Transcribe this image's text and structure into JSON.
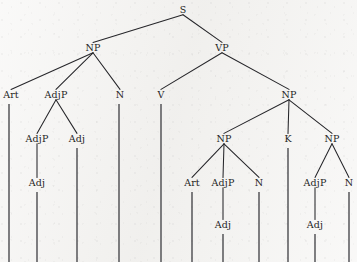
{
  "figure": {
    "kind": "constituency-syntax-tree",
    "width": 357,
    "height": 262,
    "background_color": "#f3f2f0",
    "ink_color": "#26262a",
    "text_color": "#1d1d1d"
  },
  "chart_data": {
    "type": "diagram",
    "title": "",
    "nodes": [
      {
        "id": "S",
        "label": "S",
        "x": 183,
        "y": 13,
        "parent": null
      },
      {
        "id": "NP1",
        "label": "NP",
        "x": 93,
        "y": 51,
        "parent": "S"
      },
      {
        "id": "VP",
        "label": "VP",
        "x": 222,
        "y": 51,
        "parent": "S"
      },
      {
        "id": "Art1",
        "label": "Art",
        "x": 11,
        "y": 98,
        "parent": "NP1"
      },
      {
        "id": "AdjP1",
        "label": "AdjP",
        "x": 56,
        "y": 98,
        "parent": "NP1"
      },
      {
        "id": "N1",
        "label": "N",
        "x": 120,
        "y": 98,
        "parent": "NP1"
      },
      {
        "id": "V",
        "label": "V",
        "x": 161,
        "y": 98,
        "parent": "VP"
      },
      {
        "id": "NP2",
        "label": "NP",
        "x": 289,
        "y": 98,
        "parent": "VP"
      },
      {
        "id": "AdjP2",
        "label": "AdjP",
        "x": 37,
        "y": 142,
        "parent": "AdjP1"
      },
      {
        "id": "Adj1",
        "label": "Adj",
        "x": 77,
        "y": 142,
        "parent": "AdjP1"
      },
      {
        "id": "NP3",
        "label": "NP",
        "x": 224,
        "y": 142,
        "parent": "NP2"
      },
      {
        "id": "K",
        "label": "K",
        "x": 288,
        "y": 142,
        "parent": "NP2"
      },
      {
        "id": "NP4",
        "label": "NP",
        "x": 332,
        "y": 142,
        "parent": "NP2"
      },
      {
        "id": "Adj2",
        "label": "Adj",
        "x": 37,
        "y": 186,
        "parent": "AdjP2"
      },
      {
        "id": "Art2",
        "label": "Art",
        "x": 192,
        "y": 186,
        "parent": "NP3"
      },
      {
        "id": "AdjP3",
        "label": "AdjP",
        "x": 223,
        "y": 186,
        "parent": "NP3"
      },
      {
        "id": "N2",
        "label": "N",
        "x": 259,
        "y": 186,
        "parent": "NP3"
      },
      {
        "id": "AdjP4",
        "label": "AdjP",
        "x": 315,
        "y": 186,
        "parent": "NP4"
      },
      {
        "id": "N3",
        "label": "N",
        "x": 349,
        "y": 186,
        "parent": "NP4"
      },
      {
        "id": "Adj3",
        "label": "Adj",
        "x": 223,
        "y": 228,
        "parent": "AdjP3"
      },
      {
        "id": "Adj4",
        "label": "Adj",
        "x": 315,
        "y": 228,
        "parent": "AdjP4"
      }
    ],
    "terminal_stems": [
      {
        "from": "Art1",
        "x": 9,
        "y_top": 104,
        "y_bottom": 262
      },
      {
        "from": "Adj2",
        "x": 37,
        "y_top": 192,
        "y_bottom": 262
      },
      {
        "from": "Adj1",
        "x": 77,
        "y_top": 148,
        "y_bottom": 262
      },
      {
        "from": "N1",
        "x": 119,
        "y_top": 104,
        "y_bottom": 262
      },
      {
        "from": "V",
        "x": 161,
        "y_top": 104,
        "y_bottom": 262
      },
      {
        "from": "Art2",
        "x": 192,
        "y_top": 192,
        "y_bottom": 262
      },
      {
        "from": "Adj3",
        "x": 223,
        "y_top": 234,
        "y_bottom": 262
      },
      {
        "from": "N2",
        "x": 259,
        "y_top": 192,
        "y_bottom": 262
      },
      {
        "from": "K",
        "x": 288,
        "y_top": 148,
        "y_bottom": 262
      },
      {
        "from": "Adj4",
        "x": 315,
        "y_top": 234,
        "y_bottom": 262
      },
      {
        "from": "N3",
        "x": 349,
        "y_top": 192,
        "y_bottom": 262
      }
    ],
    "legend": [],
    "annotations": []
  }
}
